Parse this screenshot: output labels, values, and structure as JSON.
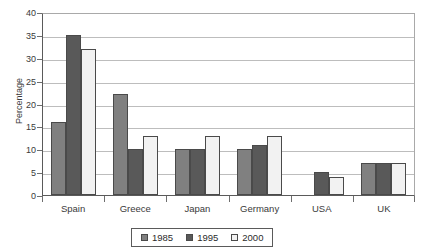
{
  "chart_data": {
    "type": "bar",
    "title": "",
    "xlabel": "",
    "ylabel": "Percentage",
    "ylim": [
      0,
      40
    ],
    "yticks": [
      0,
      5,
      10,
      15,
      20,
      25,
      30,
      35,
      40
    ],
    "grid": true,
    "legend_position": "bottom",
    "categories": [
      "Spain",
      "Greece",
      "Japan",
      "Germany",
      "USA",
      "UK"
    ],
    "series": [
      {
        "name": "1985",
        "color": "#808080",
        "values": [
          16,
          22,
          10,
          10,
          null,
          7
        ]
      },
      {
        "name": "1995",
        "color": "#595959",
        "values": [
          35,
          10,
          10,
          11,
          5,
          7
        ]
      },
      {
        "name": "2000",
        "color": "#f2f2f2",
        "values": [
          32,
          13,
          13,
          13,
          4,
          7
        ]
      }
    ]
  },
  "legend": {
    "items": [
      {
        "label": "1985",
        "color": "#808080"
      },
      {
        "label": "1995",
        "color": "#595959"
      },
      {
        "label": "2000",
        "color": "#f2f2f2"
      }
    ]
  }
}
